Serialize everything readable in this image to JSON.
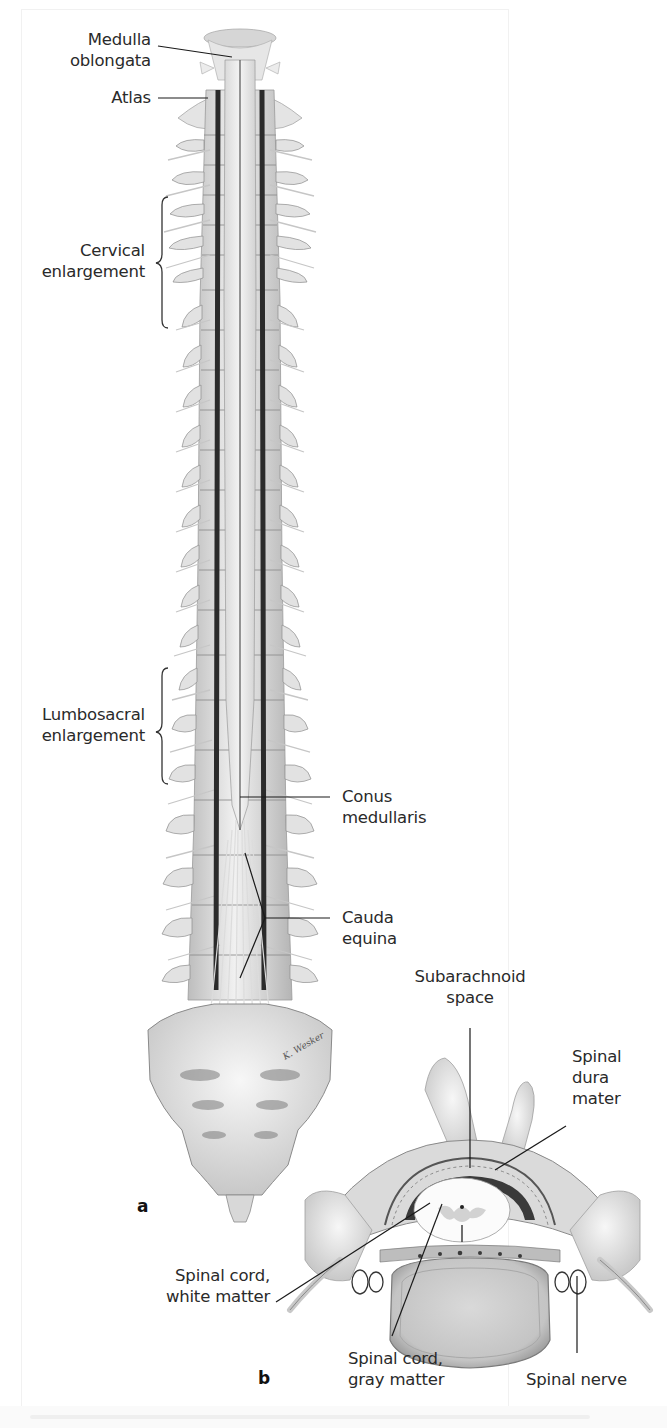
{
  "figure": {
    "panels": [
      {
        "id": "a",
        "label": "a",
        "description": "Posterior view of spinal cord within opened vertebral canal"
      },
      {
        "id": "b",
        "label": "b",
        "description": "Transverse section through vertebra and spinal cord"
      }
    ],
    "signature": "K. Wesker"
  },
  "labels": {
    "medulla": {
      "line1": "Medulla",
      "line2": "oblongata"
    },
    "atlas": {
      "line1": "Atlas"
    },
    "cervical": {
      "line1": "Cervical",
      "line2": "enlargement"
    },
    "lumbosacral": {
      "line1": "Lumbosacral",
      "line2": "enlargement"
    },
    "conus": {
      "line1": "Conus",
      "line2": "medullaris"
    },
    "cauda": {
      "line1": "Cauda",
      "line2": "equina"
    },
    "subarachnoid": {
      "line1": "Subarachnoid",
      "line2": "space"
    },
    "dura": {
      "line1": "Spinal",
      "line2": "dura",
      "line3": "mater"
    },
    "white_matter": {
      "line1": "Spinal cord,",
      "line2": "white matter"
    },
    "gray_matter": {
      "line1": "Spinal cord,",
      "line2": "gray matter"
    },
    "spinal_nerve": {
      "line1": "Spinal nerve"
    }
  },
  "colors": {
    "bone_light": "#eeeeee",
    "bone_mid": "#cfcfcf",
    "bone_dark": "#8a8a8a",
    "canal_dark": "#2b2b2b",
    "text": "#2a2a2a",
    "leader": "#1a1a1a"
  }
}
